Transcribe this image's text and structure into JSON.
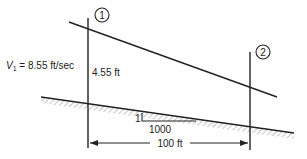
{
  "diagram": {
    "sections": [
      {
        "id": "1",
        "label": "1"
      },
      {
        "id": "2",
        "label": "2"
      }
    ],
    "velocity": {
      "symbol": "V",
      "subscript": "1",
      "text": " = 8.55 ft/sec"
    },
    "depth_label": "4.55 ft",
    "slope": {
      "rise": "1",
      "run": "1000"
    },
    "distance_label": "100 ft",
    "colors": {
      "line": "#222222",
      "hatch": "#9a9a9a",
      "background": "#ffffff"
    }
  }
}
